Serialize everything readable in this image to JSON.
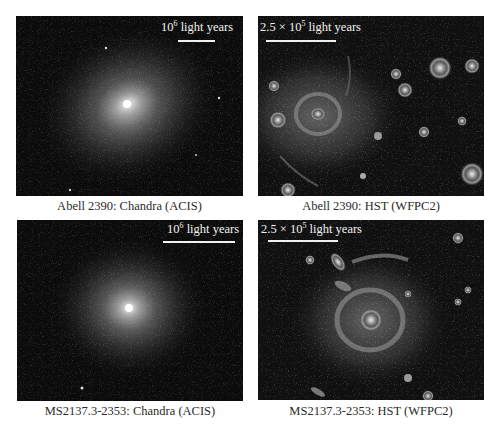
{
  "figure": {
    "panels": [
      {
        "id": "abell2390-chandra",
        "caption": "Abell 2390: Chandra (ACIS)",
        "scale_base": "10",
        "scale_exp": "6",
        "scale_unit": "light years",
        "type": "x-ray"
      },
      {
        "id": "abell2390-hst",
        "caption": "Abell 2390: HST (WFPC2)",
        "scale_base": "2.5 × 10",
        "scale_exp": "5",
        "scale_unit": "light years",
        "type": "optical"
      },
      {
        "id": "ms2137-chandra",
        "caption": "MS2137.3-2353: Chandra (ACIS)",
        "scale_base": "10",
        "scale_exp": "6",
        "scale_unit": "light years",
        "type": "x-ray"
      },
      {
        "id": "ms2137-hst",
        "caption": "MS2137.3-2353: HST (WFPC2)",
        "scale_base": "2.5 × 10",
        "scale_exp": "5",
        "scale_unit": "light years",
        "type": "optical"
      }
    ]
  },
  "colors": {
    "background": "#ffffff",
    "panel_bg": "#0b0b0b",
    "scale_text": "#f2f2f2",
    "caption_text": "#2a2a2a"
  }
}
